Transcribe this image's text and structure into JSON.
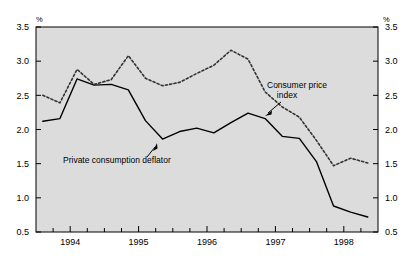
{
  "chart_data": {
    "type": "line",
    "title": "",
    "subtitle": "",
    "xlabel": "",
    "ylabel": "",
    "y_unit_label": "%",
    "ylim": [
      0.5,
      3.5
    ],
    "y_ticks": [
      0.5,
      1.0,
      1.5,
      2.0,
      2.5,
      3.0,
      3.5
    ],
    "y_tick_labels": [
      "0.5",
      "1.0",
      "1.5",
      "2.0",
      "2.5",
      "3.0",
      "3.5"
    ],
    "dual_axis": true,
    "right_axis_same_scale": true,
    "grid": false,
    "legend": "none",
    "plot_background": "#dcdcdc",
    "xlim": [
      1993.5,
      1998.5
    ],
    "x_tick_values": [
      1993.75,
      1994.0,
      1994.25,
      1994.5,
      1994.75,
      1995.0,
      1995.25,
      1995.5,
      1995.75,
      1996.0,
      1996.25,
      1996.5,
      1996.75,
      1997.0,
      1997.25,
      1997.5,
      1997.75,
      1998.0,
      1998.25
    ],
    "x_major_ticks": [
      1994,
      1995,
      1996,
      1997,
      1998
    ],
    "x_tick_labels": [
      "1994",
      "1995",
      "1996",
      "1997",
      "1998"
    ],
    "x": [
      1993.6,
      1993.85,
      1994.1,
      1994.35,
      1994.6,
      1994.85,
      1995.1,
      1995.35,
      1995.6,
      1995.85,
      1996.1,
      1996.35,
      1996.6,
      1996.85,
      1997.1,
      1997.35,
      1997.6,
      1997.85,
      1998.1,
      1998.35
    ],
    "series": [
      {
        "name": "Private consumption deflator",
        "style": "solid",
        "color": "#000000",
        "values": [
          2.12,
          2.16,
          2.74,
          2.65,
          2.66,
          2.58,
          2.13,
          1.86,
          1.97,
          2.02,
          1.95,
          2.1,
          2.24,
          2.16,
          1.9,
          1.87,
          1.53,
          0.88,
          0.79,
          0.72
        ]
      },
      {
        "name": "Consumer price index",
        "style": "dotted",
        "color": "#333333",
        "values": [
          2.5,
          2.39,
          2.88,
          2.66,
          2.73,
          3.08,
          2.75,
          2.64,
          2.69,
          2.82,
          2.94,
          3.16,
          3.03,
          2.55,
          2.33,
          2.18,
          1.84,
          1.47,
          1.58,
          1.51
        ]
      }
    ],
    "annotations": [
      {
        "text_line_1": "Consumer price",
        "text_line_2": "index",
        "target_series": "Consumer price index"
      },
      {
        "text_line_1": "Private consumption deflator",
        "text_line_2": "",
        "target_series": "Private consumption deflator"
      }
    ]
  }
}
